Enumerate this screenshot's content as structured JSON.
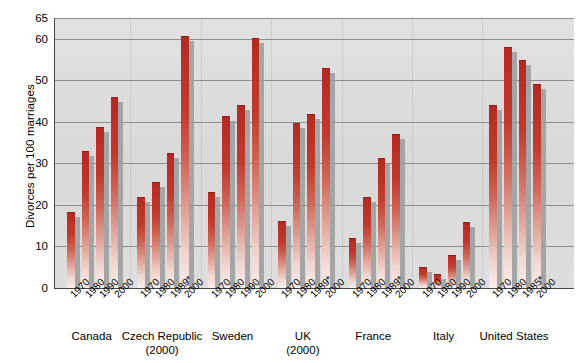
{
  "chart_data": {
    "type": "bar",
    "title": "",
    "xlabel": "",
    "ylabel": "Divorces per 100 marriages",
    "ylim": [
      0,
      65
    ],
    "yticks": [
      0,
      10,
      20,
      30,
      40,
      50,
      60,
      65
    ],
    "ytick_labels": [
      "0",
      "10",
      "20",
      "30",
      "40",
      "50",
      "60",
      "65"
    ],
    "grid": true,
    "legend": "none",
    "note": "Asterisk (*) marks a year substituted for the nominal decade point; parenthetical year under a country name marks the latest year available.",
    "groups": [
      {
        "country": "Canada",
        "country_note": "",
        "categories": [
          "1970",
          "1980",
          "1990",
          "2000"
        ],
        "values": [
          18.4,
          33.0,
          38.8,
          46.0
        ]
      },
      {
        "country": "Czech Republic",
        "country_note": "(2000)",
        "categories": [
          "1970",
          "1980",
          "1989*",
          "2000"
        ],
        "values": [
          21.8,
          25.6,
          32.6,
          60.7
        ]
      },
      {
        "country": "Sweden",
        "country_note": "",
        "categories": [
          "1970",
          "1980",
          "1990",
          "2000"
        ],
        "values": [
          23.2,
          41.4,
          44.0,
          60.2
        ]
      },
      {
        "country": "UK",
        "country_note": "(2000)",
        "categories": [
          "1970",
          "1980",
          "1989*",
          "2000"
        ],
        "values": [
          16.2,
          39.8,
          42.0,
          53.0
        ]
      },
      {
        "country": "France",
        "country_note": "",
        "categories": [
          "1970",
          "1980",
          "1989*",
          "2000"
        ],
        "values": [
          12.0,
          21.8,
          31.3,
          37.0
        ]
      },
      {
        "country": "Italy",
        "country_note": "",
        "categories": [
          "1970",
          "1980",
          "1990",
          "2000"
        ],
        "values": [
          5.0,
          3.3,
          8.0,
          16.0
        ]
      },
      {
        "country": "United States",
        "country_note": "",
        "categories": [
          "1970",
          "1980",
          "1985*",
          "2000"
        ],
        "values": [
          44.0,
          58.0,
          55.0,
          49.0
        ]
      }
    ],
    "colors": {
      "bar_top": "#b22a22",
      "bar_bottom": "#f9eeeb",
      "bar_shadow": "#9b9b9b",
      "plot_background": "#dcdcdc",
      "gridline": "#8d8d8d",
      "axis": "#4a4a4a",
      "text": "#000000"
    }
  }
}
